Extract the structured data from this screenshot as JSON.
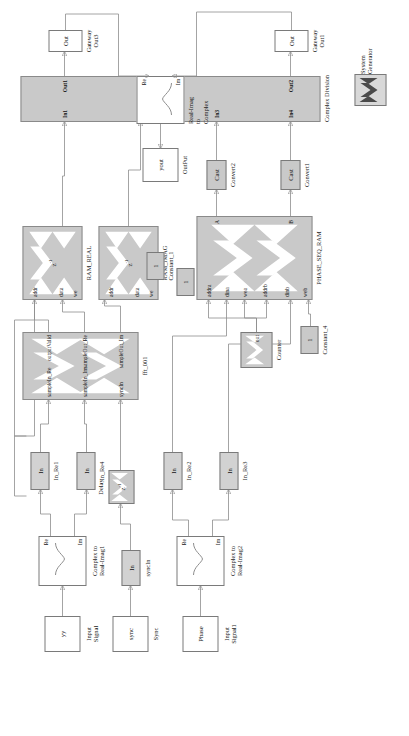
{
  "diagram": {
    "orientation": "rotated-90"
  },
  "sysgen": {
    "icon": "xilinx-x-icon",
    "label_line1": "System",
    "label_line2": "Generator"
  },
  "blocks": {
    "yout": {
      "inner": "yout",
      "label": "OutPut"
    },
    "ri2complex": {
      "port_re": "Re",
      "port_im": "Im",
      "label": "Real-Imag\nto\nComplex"
    },
    "gateway_out3": {
      "inner": "Out",
      "label": "Gateway\nOut3"
    },
    "gateway_out1": {
      "inner": "Out",
      "label": "Gateway\nOut1"
    },
    "complex_division": {
      "label": "Complex Division",
      "in_ports": [
        "In1",
        "In2",
        "In3",
        "In4"
      ],
      "out_ports": [
        "Out1",
        "Out2"
      ]
    },
    "counter_1_201": {
      "inner": "out",
      "label": "Counter (1 - 201)"
    },
    "ram_real": {
      "inner": "z",
      "inner_sup": "-1",
      "label": "RAM_REAL",
      "ports": [
        "addr",
        "data",
        "we"
      ]
    },
    "ram_imag": {
      "inner": "z",
      "inner_sup": "-1",
      "label": "RAM_IMAG",
      "ports": [
        "addr",
        "data",
        "we"
      ]
    },
    "constant_1": {
      "inner": "1",
      "label": "Constant_1"
    },
    "constant_2": {
      "inner": "1",
      "label": "Constant_2"
    },
    "constant_4": {
      "inner": "1",
      "label": "Constant_4"
    },
    "convert1": {
      "inner": "Cast",
      "label": "Convert1"
    },
    "convert2": {
      "inner": "Cast",
      "label": "Convert2"
    },
    "phase_seq_ram": {
      "label": "PHASE_SEQ_RAM",
      "in_ports": [
        "addra",
        "dina",
        "wea",
        "addrb",
        "dinb",
        "web"
      ],
      "out_ports": [
        "A",
        "B"
      ]
    },
    "counter": {
      "inner": "out",
      "label": "Counter"
    },
    "fft": {
      "label": "fft_001",
      "in_ports": [
        "sampleIn_Re",
        "sampleIn_Im",
        "syncIn"
      ],
      "out_ports": [
        "outputValid",
        "sampleOut_Re",
        "sampleOut_Im"
      ]
    },
    "delay": {
      "inner": "z",
      "inner_sup": "-1",
      "label": "Delay"
    },
    "in_re1": {
      "inner": "In",
      "label": "In_Re1"
    },
    "in_re4": {
      "inner": "In",
      "label": "In_Re4"
    },
    "in_re2": {
      "inner": "In",
      "label": "In_Re2"
    },
    "in_re3": {
      "inner": "In",
      "label": "In_Re3"
    },
    "syncin": {
      "inner": "In",
      "label": "syncIn"
    },
    "c2ri_1": {
      "port_re": "Re",
      "port_im": "Im",
      "label": "Complex to\nReal-Imag1"
    },
    "c2ri_2": {
      "port_re": "Re",
      "port_im": "Im",
      "label": "Complex to\nReal-Imag2"
    },
    "input_signal": {
      "inner": "yy",
      "label": "Input\nSignal"
    },
    "input_signal1": {
      "inner": "Phase",
      "label": "Input\nSignal1"
    },
    "sync": {
      "inner": "sync",
      "label": "Sync"
    }
  },
  "colors": {
    "block_fill": "#c9c9c9",
    "white_fill": "#ffffff",
    "stroke": "#8d8d8d",
    "text": "#111111"
  }
}
